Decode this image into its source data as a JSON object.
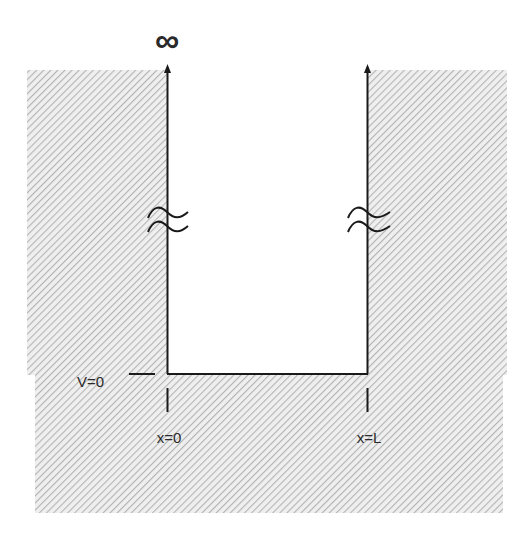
{
  "diagram": {
    "colors": {
      "background": "#ffffff",
      "hatch_stroke": "#b8b8b8",
      "hatch_bg": "#ececec",
      "line": "#1a1a1a",
      "text": "#2a2a2a"
    },
    "labels": {
      "infinity": "∞",
      "potential_zero": "V=0",
      "left_wall": "x=0",
      "right_wall": "x=L"
    },
    "break_symbol": "≈"
  }
}
